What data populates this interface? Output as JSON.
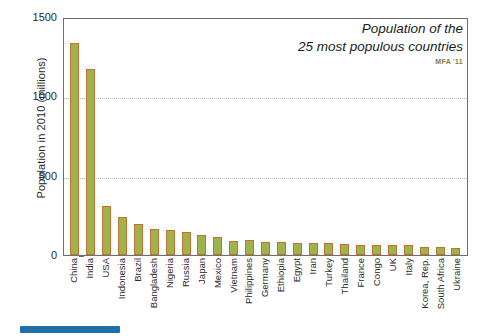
{
  "chart_data": {
    "type": "bar",
    "title": "Population of the 25 most populous countries",
    "title_lines": [
      "Population of the",
      "25 most populous countries"
    ],
    "credit": "MFA '11",
    "xlabel": "",
    "ylabel": "Population in 2010  (millions)",
    "ylim": [
      0,
      1500
    ],
    "yticks": [
      0,
      500,
      1000,
      1500
    ],
    "ytick_labels": [
      "0",
      "500",
      "1000",
      "1500"
    ],
    "grid": "horizontal-dotted",
    "legend": "none",
    "bar_color": "#9cb44b",
    "bar_edge_color": "#c2712f",
    "categories": [
      "China",
      "India",
      "USA",
      "Indonesia",
      "Brazil",
      "Bangladesh",
      "Nigeria",
      "Russia",
      "Japan",
      "Mexico",
      "Vietnam",
      "Philippines",
      "Germany",
      "Ethiopia",
      "Egypt",
      "Iran",
      "Turkey",
      "Thailand",
      "France",
      "Congo",
      "UK",
      "Italy",
      "Korea, Rep.",
      "South Africa",
      "Ukraine"
    ],
    "values": [
      1338,
      1171,
      309,
      240,
      195,
      164,
      158,
      142,
      127,
      113,
      87,
      93,
      82,
      83,
      78,
      74,
      73,
      69,
      65,
      66,
      62,
      60,
      49,
      50,
      46
    ]
  },
  "bottom_indicator": {
    "name": "progress-bar",
    "color": "#1f6fa8"
  }
}
